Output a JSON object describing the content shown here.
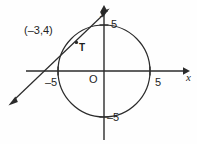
{
  "figure": {
    "type": "geometry-diagram",
    "axes": {
      "x_axis_label": "x",
      "y_axis_label": "y",
      "origin_label": "O",
      "x_ticks": [
        {
          "value": -5,
          "label": "–5"
        },
        {
          "value": 5,
          "label": "5"
        }
      ],
      "y_ticks": [
        {
          "value": 5,
          "label": "5"
        },
        {
          "value": -5,
          "label": "–5"
        }
      ]
    },
    "circle": {
      "center": [
        0,
        0
      ],
      "radius": 5
    },
    "tangent_line": {
      "point_label": "(–3,4)",
      "tangent_point_label": "T",
      "tangent_point": [
        -3,
        4
      ]
    },
    "colors": {
      "stroke": "#2b2b2b",
      "text": "#1f1f1f",
      "background": "#fefefe"
    }
  }
}
